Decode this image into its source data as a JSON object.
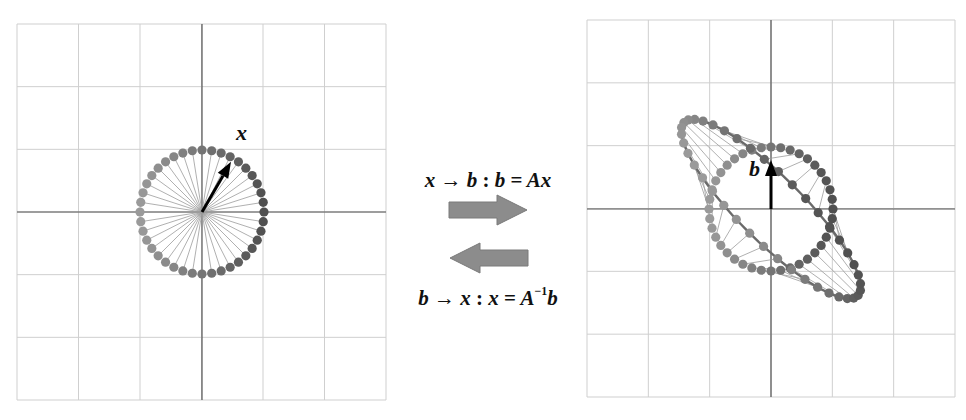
{
  "figure": {
    "background": "#ffffff",
    "grid_color": "#cfcfcf",
    "axis_color": "#555555",
    "dot_dark": "#505050",
    "dot_light": "#9a9a9a",
    "spoke_color": "#9c9c9c",
    "arrow_fill": "#8c8c8c",
    "arrow_stroke": "#7a7a7a"
  },
  "left_panel": {
    "name": "input-space",
    "bounds": {
      "x0": 17,
      "y0": 24,
      "x1": 386,
      "y1": 400
    },
    "grid_divisions": 6,
    "origin": {
      "x": 202,
      "y": 212
    },
    "circle_radius_px": 62,
    "num_points": 40,
    "vector_label": "x",
    "vector_angle_deg": 60,
    "label_pos": {
      "x": 236,
      "y": 120
    }
  },
  "right_panel": {
    "name": "output-space",
    "bounds": {
      "x0": 587,
      "y0": 20,
      "x1": 955,
      "y1": 397
    },
    "grid_divisions": 6,
    "origin": {
      "x": 771,
      "y": 209
    },
    "circle_radius_px": 62,
    "num_points": 40,
    "vector_label": "b",
    "vector_tip": {
      "x": 771,
      "y": 160
    },
    "label_pos": {
      "x": 749,
      "y": 156
    },
    "matrix_A": [
      [
        1.237,
        -0.751
      ],
      [
        -0.709,
        1.261
      ]
    ]
  },
  "middle": {
    "forward_equation": {
      "lhs": "x",
      "arrow": "→",
      "rhs": "b",
      "sep": ":",
      "result": "b",
      "eq": "=",
      "expr": "Ax"
    },
    "inverse_equation": {
      "lhs": "b",
      "arrow": "→",
      "rhs": "x",
      "sep": ":",
      "result": "x",
      "eq": "=",
      "expr_base": "A",
      "expr_sup": "−1",
      "expr_tail": "b"
    },
    "forward_arrow": "right-arrow",
    "inverse_arrow": "left-arrow"
  }
}
